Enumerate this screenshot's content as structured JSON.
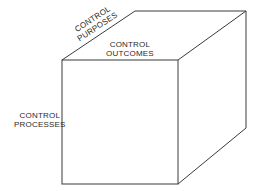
{
  "diagram": {
    "type": "cube",
    "stroke_color": "#3a3a3a",
    "background": "#ffffff",
    "labels": {
      "purposes": {
        "line1": "CONTROL",
        "line2": "PURPOSES",
        "position": "top-left edge (depth axis)"
      },
      "outcomes": {
        "line1": "CONTROL",
        "line2": "OUTCOMES",
        "position": "top front edge (width axis)"
      },
      "processes": {
        "line1": "CONTROL",
        "line2": "PROCESSES",
        "position": "left front edge (height axis)"
      }
    }
  }
}
